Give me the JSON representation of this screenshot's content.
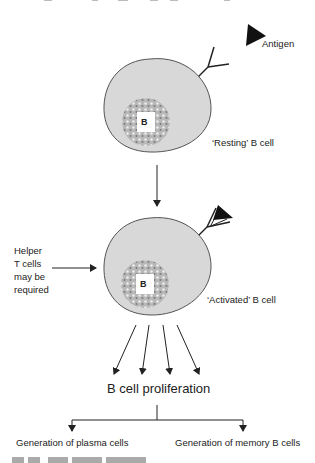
{
  "diagram": {
    "type": "flow",
    "top_cut_text": "",
    "labels": {
      "antigen": "Antigen",
      "resting": "‘Resting’ B cell",
      "activated": "‘Activated’ B cell",
      "helper": [
        "Helper",
        "T cells",
        "may be",
        "required"
      ],
      "nucleus_letter": "B",
      "proliferation": "B cell proliferation",
      "plasma": "Generation of plasma cells",
      "memory": "Generation of memory B cells",
      "caption": "Fig. 13  The cell..."
    },
    "nodes": [
      {
        "id": "antigen",
        "label": "Antigen"
      },
      {
        "id": "resting",
        "label": "‘Resting’ B cell"
      },
      {
        "id": "activated",
        "label": "‘Activated’ B cell"
      },
      {
        "id": "helper",
        "label": "Helper T cells may be required"
      },
      {
        "id": "prolif",
        "label": "B cell proliferation"
      },
      {
        "id": "plasma",
        "label": "Generation of plasma cells"
      },
      {
        "id": "memory",
        "label": "Generation of memory B cells"
      }
    ],
    "edges": [
      {
        "from": "resting",
        "to": "activated"
      },
      {
        "from": "helper",
        "to": "activated"
      },
      {
        "from": "activated",
        "to": "prolif",
        "count": 4
      },
      {
        "from": "prolif",
        "to": "plasma"
      },
      {
        "from": "prolif",
        "to": "memory"
      }
    ],
    "colors": {
      "cell_fill": "#dcdcdc",
      "cell_stroke": "#555555",
      "nucleus": "#9a9a9a",
      "line": "#222222"
    }
  }
}
